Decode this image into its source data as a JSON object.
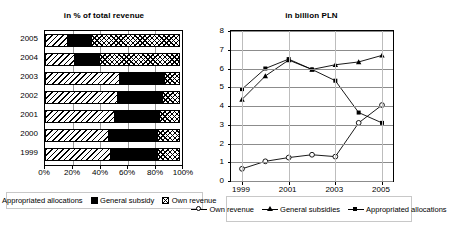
{
  "bar_chart": {
    "title": "in % of total revenue",
    "y_categories": [
      "2005",
      "2004",
      "2003",
      "2002",
      "2001",
      "2000",
      "1999"
    ],
    "x_ticks": [
      "0%",
      "20%",
      "40%",
      "60%",
      "80%",
      "100%"
    ],
    "legend": [
      {
        "label": "Appropriated allocations",
        "pattern": "diagonal-hatch"
      },
      {
        "label": "General subsidy",
        "pattern": "solid-black"
      },
      {
        "label": "Own revenue",
        "pattern": "cross-hatch-dots"
      }
    ]
  },
  "line_chart": {
    "title": "in billion PLN",
    "x_ticks": [
      "1999",
      "2001",
      "2003",
      "2005"
    ],
    "y_ticks": [
      "0",
      "1",
      "2",
      "3",
      "4",
      "5",
      "6",
      "7",
      "8"
    ],
    "legend": [
      {
        "label": "Own revenue",
        "marker": "open-circle"
      },
      {
        "label": "General subsidies",
        "marker": "filled-triangle"
      },
      {
        "label": "Appropriated allocations",
        "marker": "filled-square"
      }
    ]
  },
  "chart_data": [
    {
      "type": "bar",
      "subtype": "stacked-100-horizontal",
      "title": "in % of total revenue",
      "xlabel": "",
      "ylabel": "",
      "xlim": [
        0,
        100
      ],
      "grid": true,
      "legend_position": "bottom",
      "categories": [
        "2005",
        "2004",
        "2003",
        "2002",
        "2001",
        "2000",
        "1999"
      ],
      "tick_labels": [
        "0%",
        "20%",
        "40%",
        "60%",
        "80%",
        "100%"
      ],
      "series": [
        {
          "name": "Appropriated allocations",
          "values": [
            17,
            22,
            55,
            53,
            51,
            47,
            48
          ]
        },
        {
          "name": "General subsidy",
          "values": [
            18,
            19,
            33,
            34,
            34,
            36,
            35
          ]
        },
        {
          "name": "Own revenue",
          "values": [
            65,
            59,
            12,
            13,
            15,
            17,
            17
          ]
        }
      ]
    },
    {
      "type": "line",
      "title": "in billion PLN",
      "xlabel": "",
      "ylabel": "",
      "ylim": [
        0,
        8
      ],
      "grid": true,
      "legend_position": "bottom",
      "x": [
        1999,
        2000,
        2001,
        2002,
        2003,
        2004,
        2005
      ],
      "series": [
        {
          "name": "Own revenue",
          "marker": "open-circle",
          "values": [
            0.65,
            1.05,
            1.25,
            1.4,
            1.3,
            3.1,
            4.05
          ]
        },
        {
          "name": "General subsidies",
          "marker": "filled-triangle",
          "values": [
            4.35,
            5.6,
            6.45,
            5.95,
            6.2,
            6.35,
            6.7
          ]
        },
        {
          "name": "Appropriated allocations",
          "marker": "filled-square",
          "values": [
            4.9,
            6.0,
            6.5,
            5.95,
            5.35,
            3.65,
            3.1
          ]
        }
      ]
    }
  ]
}
